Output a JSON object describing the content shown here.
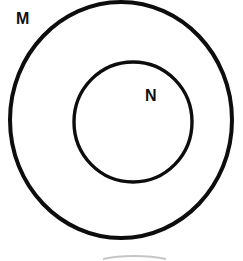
{
  "figure": {
    "type": "euler-diagram",
    "background_color": "#ffffff",
    "stroke_color": "#0d0d0d",
    "width": 243,
    "height": 261
  },
  "sets": [
    {
      "id": "outer",
      "label": "M",
      "shape": "circle",
      "center": {
        "x": 121,
        "y": 120
      },
      "radius_x": 111,
      "radius_y": 118,
      "stroke_width": 4,
      "fill": "none",
      "label_position": "outside-top-left"
    },
    {
      "id": "inner",
      "label": "N",
      "shape": "circle",
      "center": {
        "x": 133,
        "y": 122
      },
      "radius_x": 59,
      "radius_y": 60,
      "stroke_width": 3.4,
      "fill": "none",
      "label_position": "inside-upper-right"
    }
  ],
  "artifact": {
    "name": "page-edge-arc",
    "color": "#b9b9b9",
    "note": "faint cropped arc at bottom of scan"
  }
}
